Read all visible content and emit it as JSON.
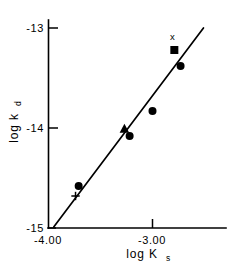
{
  "figure": {
    "background_color": "#ffffff",
    "ink_color": "#000000"
  },
  "chart_data": {
    "type": "scatter",
    "title": "",
    "subtitle": "",
    "xlabel": "log K",
    "xlabel_subscript": "s",
    "ylabel": "log k",
    "ylabel_subscript": "d",
    "xlim": [
      -4.0,
      -2.4
    ],
    "ylim": [
      -15.0,
      -12.85
    ],
    "grid": false,
    "legend": "none",
    "x_ticks": [
      -4.0,
      -3.0
    ],
    "x_tick_labels": [
      "-4.00",
      "-3.00"
    ],
    "y_ticks": [
      -13,
      -14,
      -15
    ],
    "y_tick_labels": [
      "-13",
      "-14",
      "-15"
    ],
    "axis_style": "left-and-bottom-spines",
    "series": [
      {
        "name": "circle-points",
        "marker": "circle",
        "points": [
          {
            "x": -3.71,
            "y": -14.58
          },
          {
            "x": -3.22,
            "y": -14.08
          },
          {
            "x": -3.0,
            "y": -13.83
          },
          {
            "x": -2.73,
            "y": -13.38
          }
        ]
      },
      {
        "name": "triangle-point",
        "marker": "triangle",
        "points": [
          {
            "x": -3.27,
            "y": -14.01
          }
        ]
      },
      {
        "name": "square-point",
        "marker": "square",
        "points": [
          {
            "x": -2.79,
            "y": -13.22
          }
        ]
      },
      {
        "name": "plus-point",
        "marker": "plus",
        "points": [
          {
            "x": -3.74,
            "y": -14.68
          }
        ]
      }
    ],
    "annotations": [
      {
        "text": "x",
        "x": -2.81,
        "y": -13.12
      }
    ],
    "fit_line": {
      "name": "regression-line",
      "x_start": -3.95,
      "y_start": -14.99,
      "x_end": -2.51,
      "y_end": -13.0
    }
  }
}
